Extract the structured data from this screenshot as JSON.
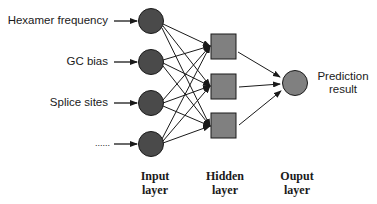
{
  "diagram": {
    "type": "neural-network",
    "inputs": [
      {
        "label": "Hexamer frequency"
      },
      {
        "label": "GC bias"
      },
      {
        "label": "Splice sites"
      },
      {
        "label": "......"
      }
    ],
    "hidden_nodes": 3,
    "output": {
      "label_line1": "Prediction",
      "label_line2": "result"
    },
    "layers": [
      {
        "line1": "Input",
        "line2": "layer"
      },
      {
        "line1": "Hidden",
        "line2": "layer"
      },
      {
        "line1": "Ouput",
        "line2": "layer"
      }
    ],
    "colors": {
      "input_node": "#4a4a4a",
      "hidden_node": "#808080",
      "output_node": "#808080",
      "stroke": "#1a1a1a"
    }
  }
}
